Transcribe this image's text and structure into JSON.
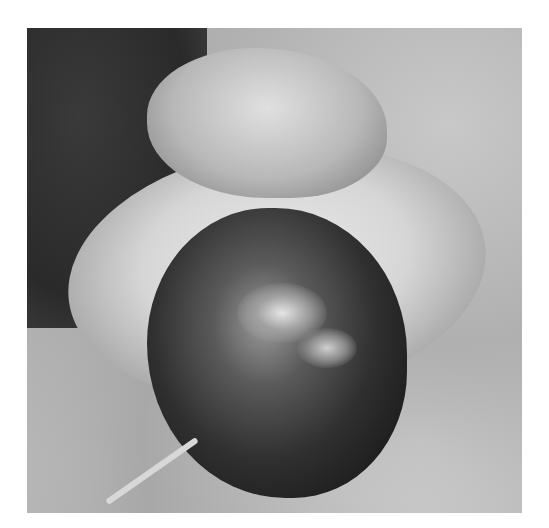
{
  "image": {
    "kind": "grayscale clinical photograph",
    "alt": "Grayscale clinical photograph of a swollen, discolored glans with necrotic dark tissue surrounded by edematous skin, on draped cloth"
  }
}
